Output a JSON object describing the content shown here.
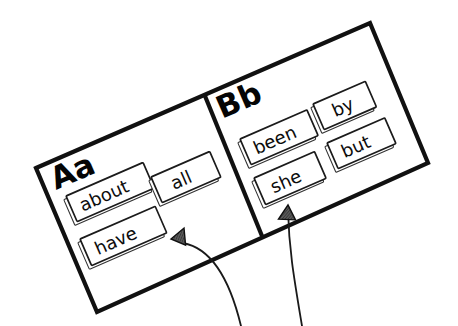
{
  "canvas": {
    "width": 458,
    "height": 326,
    "background_color": "#ffffff",
    "ink_color": "#111111"
  },
  "board": {
    "name": "word-wall-board",
    "rotation_degrees": -20,
    "panels": [
      {
        "id": "panel-a",
        "heading": "Aa",
        "cards": [
          {
            "id": "card-about",
            "word": "about"
          },
          {
            "id": "card-have",
            "word": "have"
          },
          {
            "id": "card-all",
            "word": "all"
          }
        ]
      },
      {
        "id": "panel-b",
        "heading": "Bb",
        "cards": [
          {
            "id": "card-been",
            "word": "been"
          },
          {
            "id": "card-by",
            "word": "by"
          },
          {
            "id": "card-she",
            "word": "she"
          },
          {
            "id": "card-but",
            "word": "but"
          }
        ]
      }
    ]
  },
  "annotations": {
    "arrows": [
      {
        "id": "arrow-to-have",
        "points_to": "have",
        "direction": "left"
      },
      {
        "id": "arrow-to-she",
        "points_to": "she",
        "direction": "up"
      }
    ]
  }
}
